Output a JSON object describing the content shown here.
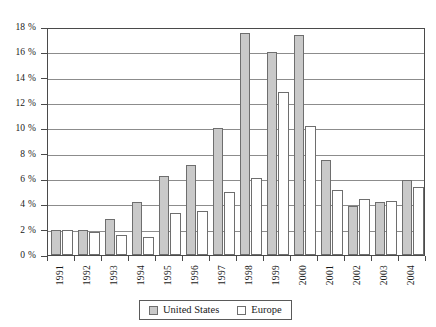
{
  "chart_data": {
    "type": "bar",
    "title": "",
    "xlabel": "",
    "ylabel": "",
    "ylim": [
      0,
      18
    ],
    "ytick_values": [
      0,
      2,
      4,
      6,
      8,
      10,
      12,
      14,
      16,
      18
    ],
    "ytick_labels": [
      "0 %",
      "2 %",
      "4 %",
      "6 %",
      "8 %",
      "10 %",
      "12 %",
      "14 %",
      "16 %",
      "18 %"
    ],
    "grid": true,
    "legend_position": "bottom",
    "categories": [
      "1991",
      "1992",
      "1993",
      "1994",
      "1995",
      "1996",
      "1997",
      "1998",
      "1999",
      "2000",
      "2001",
      "2002",
      "2003",
      "2004"
    ],
    "series": [
      {
        "name": "United States",
        "color": "#c9c9c9",
        "values": [
          2.0,
          2.0,
          2.85,
          4.2,
          6.2,
          7.1,
          10.0,
          17.5,
          16.0,
          17.4,
          7.5,
          3.9,
          4.2,
          5.9
        ]
      },
      {
        "name": "Europe",
        "color": "#ffffff",
        "values": [
          2.0,
          1.8,
          1.55,
          1.45,
          3.3,
          3.45,
          5.0,
          6.1,
          12.9,
          10.2,
          5.1,
          4.4,
          4.3,
          5.4
        ]
      }
    ]
  },
  "legend": {
    "entries": [
      {
        "label": "United States",
        "swatch": "series-us"
      },
      {
        "label": "Europe",
        "swatch": "series-eu"
      }
    ]
  }
}
